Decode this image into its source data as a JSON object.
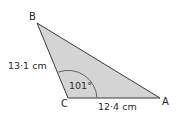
{
  "diagram": {
    "type": "triangle",
    "fill": "#d4d4d4",
    "stroke": "#3a3a3a",
    "vertices": {
      "A": {
        "label": "A",
        "x": 160,
        "y": 98
      },
      "B": {
        "label": "B",
        "x": 37,
        "y": 23
      },
      "C": {
        "label": "C",
        "x": 68,
        "y": 98
      }
    },
    "sides": {
      "BC": {
        "label": "13·1 cm"
      },
      "CA": {
        "label": "12·4 cm"
      }
    },
    "angle_C": {
      "label": "101°"
    }
  }
}
